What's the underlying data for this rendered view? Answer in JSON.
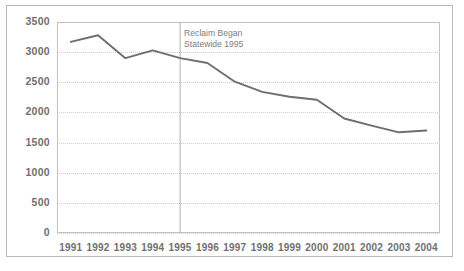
{
  "chart_data": {
    "type": "line",
    "title": "",
    "xlabel": "",
    "ylabel": "",
    "categories": [
      "1991",
      "1992",
      "1993",
      "1994",
      "1995",
      "1996",
      "1997",
      "1998",
      "1999",
      "2000",
      "2001",
      "2002",
      "2003",
      "2004"
    ],
    "values": [
      3170,
      3280,
      2900,
      3030,
      2900,
      2820,
      2510,
      2340,
      2260,
      2210,
      1900,
      1780,
      1670,
      1700
    ],
    "series": [
      {
        "name": "",
        "values": [
          3170,
          3280,
          2900,
          3030,
          2900,
          2820,
          2510,
          2340,
          2260,
          2210,
          1900,
          1780,
          1670,
          1700
        ]
      }
    ],
    "ylim": [
      0,
      3500
    ],
    "yticks": [
      0,
      500,
      1000,
      1500,
      2000,
      2500,
      3000,
      3500
    ],
    "ytick_labels": [
      "0",
      "500",
      "1000",
      "1500",
      "2000",
      "2500",
      "3000",
      "3500"
    ],
    "xtick_labels": [
      "1991",
      "1992",
      "1993",
      "1994",
      "1995",
      "1996",
      "1997",
      "1998",
      "1999",
      "2000",
      "2001",
      "2002",
      "2003",
      "2004"
    ],
    "grid": true,
    "grid_style": "dotted-horizontal",
    "legend": false,
    "legend_position": "none",
    "annotations": [
      {
        "name": "reclaim-marker",
        "type": "vertical-line",
        "x_category": "1995",
        "line1": "Reclaim Began",
        "line2": "Statewide 1995"
      }
    ],
    "colors": {
      "line": "#6e6e6e",
      "grid": "#cfcfcf",
      "frame": "#c2c2c2",
      "marker_line": "#b0b0b0",
      "tick_text": "#6f6f6f",
      "annotation_text": "#7d7d7d",
      "background": "#ffffff",
      "outer_border": "#b9b9b9"
    }
  }
}
